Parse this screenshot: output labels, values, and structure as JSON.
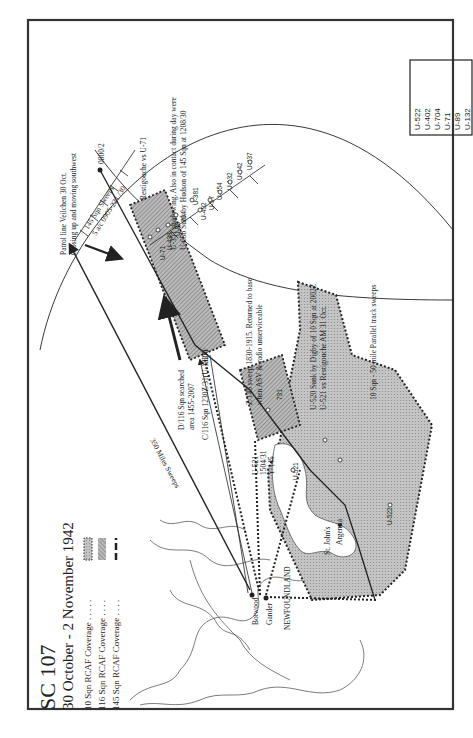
{
  "map": {
    "title": "SC 107",
    "subtitle": "30 October - 2 November 1942",
    "legend": [
      {
        "label": "10 Sqn RCAF Coverage . . . . .",
        "pattern": "grey-dotted-border"
      },
      {
        "label": "116 Sqn RCAF Coverage . . . .",
        "pattern": "hatched"
      },
      {
        "label": "145 Sqn RCAF Coverage . . . .",
        "pattern": "dash-dot"
      }
    ],
    "uboat_box": [
      "U-522",
      "U-402",
      "U-704",
      "U-71",
      "U-89",
      "U-132"
    ],
    "places": {
      "botwood": "Botwood",
      "gander": "Gander",
      "newfoundland": "NEWFOUNDLAND",
      "st_johns": "St. John's",
      "argentia": "Argentia"
    },
    "annotations": {
      "patrol_line_1": "Patrol line Veilchen 30 Oct.",
      "patrol_line_2": "Closing up and moving southwest",
      "sweeps_145_1": "145 Sqn Sweeps",
      "sweeps_145_2": "5 a/c 0905-221 /30",
      "pos_0800_2": "0800/2",
      "restigouche": "Restigouche vs U-71",
      "u351_1": "U-351 shadowing.  Also in contact during day were",
      "u351_2": "U-658 Sunk by Hudson of 145 Sqn at 1208/30",
      "z145_1": "Z/145 sweep 1830-1915. Returned to base",
      "z145_2": "when ASV & radio unserviceable",
      "u520_1": "U-520 Sunk by Digby of 10 Sqn at 2002Z",
      "u520_2": "U-521 vs Restigouche AM 31 Oct.",
      "sqn10_sweeps": "10 Sqn - 50 mile Parallel track sweeps",
      "d116_1": "D/116 Sqn searched",
      "d116_2": "area 1455-2007",
      "c116": "C/116 Sqn 1230Z/31(U-132?)",
      "u521_1": "U-521",
      "u521_2": "1504/31",
      "u521_3": "Y/145",
      "pos_0800": "0800/",
      "miles_350": "350 Miles Sweeps",
      "label_u521": "U-521",
      "label_u522": "U-522",
      "label_u71": "U-71",
      "label_u438": "U-438",
      "label_u4": "U-4",
      "label_u89": "U-89",
      "label_u704": "704",
      "label_u381": "U-381",
      "label_u402": "U-402",
      "label_u57": "U-57",
      "label_u454": "U-454",
      "label_u132": "U-132",
      "label_u442": "U-442",
      "label_u437": "U-437",
      "label_731": "731"
    },
    "colors": {
      "ink": "#222222",
      "coverage_fill": "#b8b8b8",
      "hatch_fill": "#9a9a9a",
      "paper": "#ffffff"
    }
  }
}
